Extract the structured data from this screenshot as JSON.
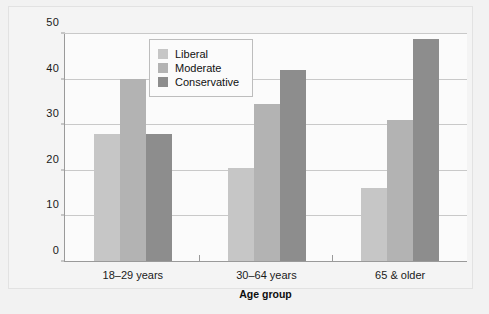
{
  "chart_data": {
    "type": "bar",
    "title": "",
    "xlabel": "Age group",
    "ylabel": "Percentage of Americans",
    "categories": [
      "18–29 years",
      "30–64 years",
      "65 & older"
    ],
    "series": [
      {
        "name": "Liberal",
        "color": "#c6c6c6",
        "values": [
          28,
          20.5,
          16
        ]
      },
      {
        "name": "Moderate",
        "color": "#b3b3b3",
        "values": [
          40,
          34.5,
          31
        ]
      },
      {
        "name": "Conservative",
        "color": "#8d8d8d",
        "values": [
          28,
          42,
          49
        ]
      }
    ],
    "ylim": [
      0,
      50
    ],
    "yticks": [
      0,
      10,
      20,
      30,
      40,
      50
    ],
    "ytick_labels": [
      "0",
      "10",
      "20",
      "30",
      "40",
      "50"
    ],
    "grid": true,
    "legend_position": "inside-upper-center"
  },
  "axes": {
    "y_title": "Percentage of Americans",
    "x_title": "Age group",
    "y_ticks": [
      {
        "value": 50,
        "label": "50"
      },
      {
        "value": 40,
        "label": "40"
      },
      {
        "value": 30,
        "label": "30"
      },
      {
        "value": 20,
        "label": "20"
      },
      {
        "value": 10,
        "label": "10"
      },
      {
        "value": 0,
        "label": "0"
      }
    ],
    "x_ticks": [
      {
        "label": "18–29 years"
      },
      {
        "label": "30–64 years"
      },
      {
        "label": "65 & older"
      }
    ]
  },
  "legend": {
    "items": [
      {
        "label": "Liberal",
        "color": "#c6c6c6"
      },
      {
        "label": "Moderate",
        "color": "#b3b3b3"
      },
      {
        "label": "Conservative",
        "color": "#8d8d8d"
      }
    ]
  },
  "colors": {
    "page_background": "#f2f2f2",
    "plot_background": "#fbfbfb",
    "gridline": "#c9c9c9",
    "axis": "#9a9a9a",
    "text": "#1a1a1a"
  }
}
